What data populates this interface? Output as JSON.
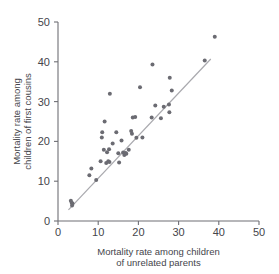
{
  "chart_data": {
    "type": "scatter",
    "title": "",
    "xlabel": "Mortality rate among children of unrelated parents",
    "ylabel": "Mortality rate among children of first cousins",
    "xlim": [
      0,
      50
    ],
    "ylim": [
      0,
      50
    ],
    "xticks": [
      0,
      10,
      20,
      30,
      40,
      50
    ],
    "yticks": [
      0,
      10,
      20,
      30,
      40,
      50
    ],
    "xtick_labels": [
      "0",
      "10",
      "20",
      "30",
      "40",
      "50"
    ],
    "ytick_labels": [
      "0",
      "10",
      "20",
      "30",
      "40",
      "50"
    ],
    "grid": false,
    "legend": false,
    "marker_color": "#6b6b72",
    "marker_size": 4,
    "axis_color": "#6f6f75",
    "series": [
      {
        "name": "countries",
        "points": [
          [
            3.2,
            5.1
          ],
          [
            3.4,
            4.6
          ],
          [
            3.6,
            4.4
          ],
          [
            3.5,
            3.9
          ],
          [
            7.8,
            11.5
          ],
          [
            8.3,
            13.2
          ],
          [
            9.5,
            10.3
          ],
          [
            10.6,
            15.0
          ],
          [
            10.9,
            21.0
          ],
          [
            11.0,
            22.3
          ],
          [
            11.4,
            17.9
          ],
          [
            11.6,
            25.0
          ],
          [
            12.0,
            14.6
          ],
          [
            12.2,
            17.3
          ],
          [
            12.5,
            15.0
          ],
          [
            12.7,
            18.0
          ],
          [
            12.8,
            14.8
          ],
          [
            12.9,
            32.0
          ],
          [
            13.6,
            19.5
          ],
          [
            14.5,
            22.3
          ],
          [
            15.0,
            17.0
          ],
          [
            15.2,
            14.7
          ],
          [
            15.8,
            20.2
          ],
          [
            16.2,
            17.2
          ],
          [
            16.5,
            16.6
          ],
          [
            16.8,
            17.1
          ],
          [
            17.0,
            16.9
          ],
          [
            17.6,
            17.9
          ],
          [
            18.2,
            22.6
          ],
          [
            18.4,
            21.9
          ],
          [
            18.6,
            26.0
          ],
          [
            19.2,
            26.1
          ],
          [
            19.5,
            20.9
          ],
          [
            20.4,
            33.6
          ],
          [
            21.0,
            21.0
          ],
          [
            23.3,
            26.0
          ],
          [
            23.5,
            39.3
          ],
          [
            24.2,
            29.0
          ],
          [
            25.6,
            25.8
          ],
          [
            26.3,
            28.7
          ],
          [
            27.6,
            29.3
          ],
          [
            27.7,
            27.3
          ],
          [
            27.8,
            36.0
          ],
          [
            28.3,
            32.8
          ],
          [
            36.5,
            40.3
          ],
          [
            39.0,
            46.3
          ]
        ]
      }
    ],
    "trend_line": {
      "name": "reference trend",
      "color": "#a9a9ae",
      "x0": 2.6,
      "y0": 2.8,
      "x1": 38.0,
      "y1": 40.7
    }
  }
}
